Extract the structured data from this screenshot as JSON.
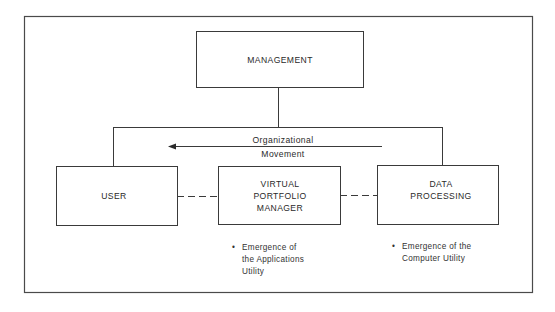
{
  "diagram": {
    "nodes": {
      "management": {
        "lines": [
          "MANAGEMENT"
        ]
      },
      "user": {
        "lines": [
          "USER"
        ]
      },
      "vpm": {
        "lines": [
          "VIRTUAL",
          "PORTFOLIO",
          "MANAGER"
        ]
      },
      "dp": {
        "lines": [
          "DATA",
          "PROCESSING"
        ]
      }
    },
    "arrow": {
      "direction": "left",
      "label_lines": [
        "Organizational",
        "Movement"
      ]
    },
    "notes": {
      "vpm": {
        "bullet": "•",
        "lines": [
          "Emergence of",
          "the Applications",
          "Utility"
        ]
      },
      "dp": {
        "bullet": "•",
        "lines": [
          "Emergence of the",
          "Computer Utility"
        ]
      }
    },
    "edges": [
      {
        "from": "management",
        "to": "user",
        "style": "solid"
      },
      {
        "from": "management",
        "to": "dp",
        "style": "solid"
      },
      {
        "from": "user",
        "to": "vpm",
        "style": "dashed"
      },
      {
        "from": "vpm",
        "to": "dp",
        "style": "dashed"
      }
    ]
  }
}
